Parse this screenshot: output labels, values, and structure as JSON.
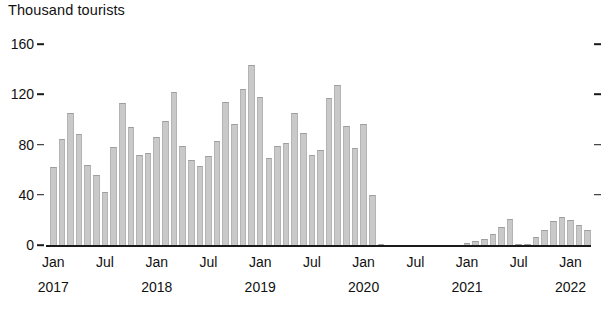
{
  "chart_data": {
    "type": "bar",
    "title": "",
    "ylabel": "Thousand tourists",
    "xlabel": "",
    "ylim": [
      0,
      160
    ],
    "yticks": [
      0,
      40,
      80,
      120,
      160
    ],
    "grid": false,
    "legend": null,
    "bar_color": "#c9c9c9",
    "x_start": "2017-01",
    "x_tick_labels": [
      {
        "month": "Jan",
        "year": "2017",
        "index": 0
      },
      {
        "month": "Jul",
        "year": "",
        "index": 6
      },
      {
        "month": "Jan",
        "year": "2018",
        "index": 12
      },
      {
        "month": "Jul",
        "year": "",
        "index": 18
      },
      {
        "month": "Jan",
        "year": "2019",
        "index": 24
      },
      {
        "month": "Jul",
        "year": "",
        "index": 30
      },
      {
        "month": "Jan",
        "year": "2020",
        "index": 36
      },
      {
        "month": "Jul",
        "year": "",
        "index": 42
      },
      {
        "month": "Jan",
        "year": "2021",
        "index": 48
      },
      {
        "month": "Jul",
        "year": "",
        "index": 54
      },
      {
        "month": "Jan",
        "year": "2022",
        "index": 60
      }
    ],
    "categories": [
      "Jan 2017",
      "Feb 2017",
      "Mar 2017",
      "Apr 2017",
      "May 2017",
      "Jun 2017",
      "Jul 2017",
      "Aug 2017",
      "Sep 2017",
      "Oct 2017",
      "Nov 2017",
      "Dec 2017",
      "Jan 2018",
      "Feb 2018",
      "Mar 2018",
      "Apr 2018",
      "May 2018",
      "Jun 2018",
      "Jul 2018",
      "Aug 2018",
      "Sep 2018",
      "Oct 2018",
      "Nov 2018",
      "Dec 2018",
      "Jan 2019",
      "Feb 2019",
      "Mar 2019",
      "Apr 2019",
      "May 2019",
      "Jun 2019",
      "Jul 2019",
      "Aug 2019",
      "Sep 2019",
      "Oct 2019",
      "Nov 2019",
      "Dec 2019",
      "Jan 2020",
      "Feb 2020",
      "Mar 2020",
      "Apr 2020",
      "May 2020",
      "Jun 2020",
      "Jul 2020",
      "Aug 2020",
      "Sep 2020",
      "Oct 2020",
      "Nov 2020",
      "Dec 2020",
      "Jan 2021",
      "Feb 2021",
      "Mar 2021",
      "Apr 2021",
      "May 2021",
      "Jun 2021",
      "Jul 2021",
      "Aug 2021",
      "Sep 2021",
      "Oct 2021",
      "Nov 2021",
      "Dec 2021",
      "Jan 2022",
      "Feb 2022",
      "Mar 2022"
    ],
    "values": [
      62,
      84,
      105,
      88,
      64,
      56,
      42,
      78,
      113,
      94,
      72,
      73,
      86,
      99,
      122,
      79,
      68,
      63,
      71,
      83,
      114,
      96,
      124,
      143,
      118,
      69,
      79,
      81,
      105,
      89,
      72,
      76,
      117,
      127,
      95,
      77,
      96,
      40,
      1,
      0,
      0,
      0,
      0,
      0,
      0,
      0,
      0,
      0,
      2,
      3,
      5,
      9,
      14,
      21,
      1,
      1,
      6,
      12,
      19,
      22,
      20,
      16,
      12
    ]
  }
}
